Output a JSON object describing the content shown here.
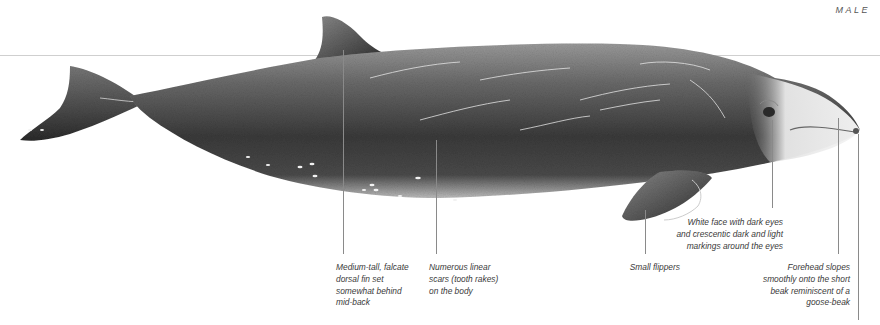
{
  "figure": {
    "sex_label": "MALE",
    "colors": {
      "background": "#ffffff",
      "waterline": "#cfcfcf",
      "leader_line": "#8a8a8a",
      "label_text": "#3a3a3a",
      "body_dark": "#2e2e2e",
      "body_mid": "#6b6b6b",
      "face_light": "#eeeeee"
    }
  },
  "annotations": [
    {
      "id": "dorsal-fin",
      "text": "Medium-tall, falcate\ndorsal fin set\nsomewhat behind\nmid-back",
      "align": "left"
    },
    {
      "id": "scars",
      "text": "Numerous linear\nscars (tooth rakes)\non the body",
      "align": "left"
    },
    {
      "id": "flippers",
      "text": "Small flippers",
      "align": "right"
    },
    {
      "id": "face",
      "text": "White face with dark eyes\nand crescentic dark and light\nmarkings around the eyes",
      "align": "right"
    },
    {
      "id": "forehead",
      "text": "Forehead slopes\nsmoothly onto the short\nbeak reminiscent of a\ngoose-beak",
      "align": "right"
    }
  ]
}
